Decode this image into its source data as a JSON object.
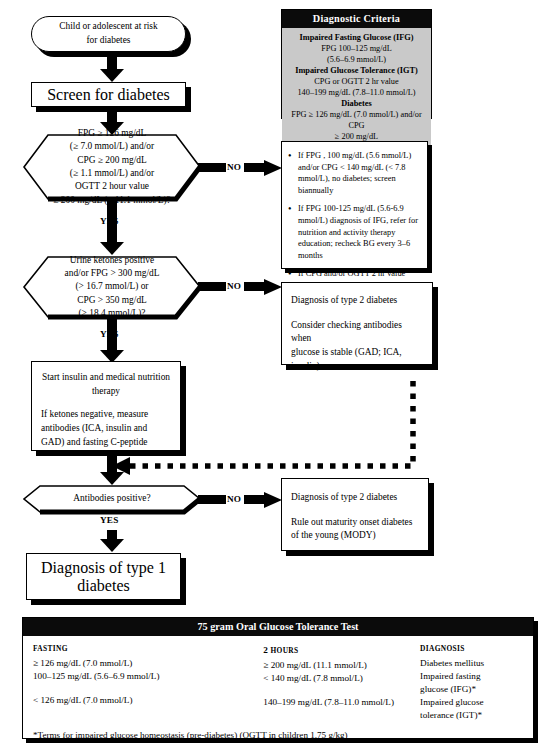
{
  "flow": {
    "start": "Child or adolescent at risk\nfor diabetes",
    "screen": "Screen for diabetes",
    "decision1": "FPG ≥ 126 mg/dL\n(≥ 7.0 mmol/L) and/or\nCPG ≥ 200 mg/dL\n(≥ 1.1 mmol/L) and/or\nOGTT 2 hour value\n≥ 200 mg/dL (≥ 11.1 mmol/L)?",
    "decision2": "Urine ketones positive\nand/or FPG > 300 mg/dL\n(> 16.7 mmol/L) or\nCPG > 350 mg/dL\n(> 18.4 mmol/L)?",
    "treatment_line1": "Start insulin and medical nutrition",
    "treatment_line2": "therapy",
    "treatment_line3": "If ketones negative, measure",
    "treatment_line4": "antibodies (ICA, insulin and",
    "treatment_line5": "GAD) and fasting C-peptide",
    "decision3": "Antibodies positive?",
    "type1": "Diagnosis of type 1 diabetes",
    "labels": {
      "yes1": "YES",
      "yes2": "YES",
      "yes3": "YES",
      "no1": "NO",
      "no2": "NO",
      "no3": "NO"
    }
  },
  "criteria": {
    "title": "Diagnostic Criteria",
    "lines": [
      {
        "bold": true,
        "text": "Impaired Fasting Glucose (IFG)"
      },
      {
        "bold": false,
        "text": "FPG 100–125 mg/dL"
      },
      {
        "bold": false,
        "text": "(5.6–6.9 mmol/L)"
      },
      {
        "bold": true,
        "text": "Impaired Glucose Tolerance (IGT)"
      },
      {
        "bold": false,
        "text": "CPG or OGTT 2 hr value"
      },
      {
        "bold": false,
        "text": "140–199 mg/dL (7.8–11.0 mmol/L)"
      },
      {
        "bold": true,
        "text": "Diabetes"
      },
      {
        "bold": false,
        "text": "FPG ≥ 126 mg/dL (7.0 mmol/L) and/or CPG"
      },
      {
        "bold": false,
        "text": "≥ 200 mg/dL"
      },
      {
        "bold": false,
        "text": "(11.1 mmol/L) on two occasions"
      }
    ]
  },
  "bullets": {
    "items": [
      "If FPG , 100 mg/dL (5.6 mmol/L) and/or CPG < 140 mg/dL (< 7.8 mmol/L), no diabetes; screen biannually",
      "If FPG 100-125 mg/dL (5.6-6.9 mmol/L) diagnosis of IFG, refer for nutrition and activity therapy education; recheck BG every 3–6 months",
      "If CPG and/or OGTT 2 hr value 140–199 mg/dL (7.8–11.0 mmol/L) diagnosis of IGT, refer for nutrition and activity therapy education recheck BG every 3–6 months"
    ]
  },
  "type2_box": {
    "line1": "Diagnosis of type 2 diabetes",
    "line2": "Consider checking antibodies when",
    "line3": "glucose is stable (GAD; ICA,",
    "line4": "insulin)"
  },
  "mody_box": {
    "line1": "Diagnosis of type 2 diabetes",
    "line2": "Rule out maturity onset diabetes",
    "line3": "of the young (MODY)"
  },
  "ogtt": {
    "title": "75 gram Oral Glucose Tolerance Test",
    "headers": {
      "fasting": "FASTING",
      "hours_num": "2",
      "hours_word": "HOURS",
      "diagnosis": "DIAGNOSIS"
    },
    "fasting": [
      "≥ 126 mg/dL (7.0 mmol/L)",
      "100–125 mg/dL (5.6–6.9 mmol/L)",
      "",
      "< 126 mg/dL (7.0 mmol/L)"
    ],
    "two_hours": [
      "≥ 200 mg/dL (11.1 mmol/L)",
      "< 140 mg/dL (7.8 mmol/L)",
      "",
      "140–199 mg/dL (7.8–11.0 mmol/L)"
    ],
    "diagnosis": [
      "Diabetes mellitus",
      "Impaired fasting",
      "glucose (IFG)*",
      "Impaired glucose",
      "tolerance (IGT)*"
    ],
    "footnote": "*Terms for impaired glucose homeostasis (pre-diabetes) (OGTT in children 1.75 g/kg)"
  },
  "colors": {
    "ink": "#000000",
    "panel_header_bg": "#0b0b0b",
    "criteria_body_bg": "#c9c9c9",
    "page_bg": "#ffffff"
  }
}
